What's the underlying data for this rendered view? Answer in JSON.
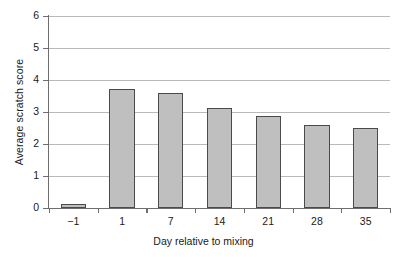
{
  "chart_data": {
    "type": "bar",
    "title": "",
    "xlabel": "Day relative to mixing",
    "ylabel": "Average scratch score",
    "categories": [
      "-1",
      "1",
      "7",
      "14",
      "21",
      "28",
      "35"
    ],
    "category_labels_display": [
      "−1",
      "1",
      "7",
      "14",
      "21",
      "28",
      "35"
    ],
    "values": [
      0.12,
      3.72,
      3.59,
      3.12,
      2.88,
      2.6,
      2.5
    ],
    "ylim": [
      0,
      6
    ],
    "y_ticks": [
      0,
      1,
      2,
      3,
      4,
      5,
      6
    ],
    "y_tick_labels": [
      "0",
      "1",
      "2",
      "3",
      "4",
      "5",
      "6"
    ],
    "grid": true,
    "grid_axis": "y",
    "legend": false,
    "legend_position": "none",
    "series": [
      {
        "name": "Average scratch score",
        "values": [
          0.12,
          3.72,
          3.59,
          3.12,
          2.88,
          2.6,
          2.5
        ]
      }
    ],
    "colors": {
      "bar_fill": "#bfbfbf",
      "bar_border": "#4a4a4a",
      "gridline": "#b9b9b9",
      "axis": "#6e6e6e",
      "text": "#1a1a1a",
      "background": "#ffffff"
    }
  }
}
